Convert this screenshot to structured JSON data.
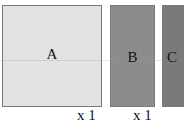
{
  "diagram": {
    "boxes": [
      {
        "label": "A",
        "fill": "#e3e3e3"
      },
      {
        "label": "B",
        "fill": "#8c8c8c"
      },
      {
        "label": "C",
        "fill": "#7a7a7a"
      }
    ],
    "multipliers": [
      {
        "label": "x 1"
      },
      {
        "label": "x 1"
      }
    ]
  }
}
